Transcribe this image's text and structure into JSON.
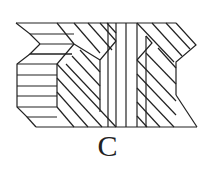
{
  "figure": {
    "label": "C",
    "stroke_color": "#222222",
    "background": "#ffffff"
  }
}
